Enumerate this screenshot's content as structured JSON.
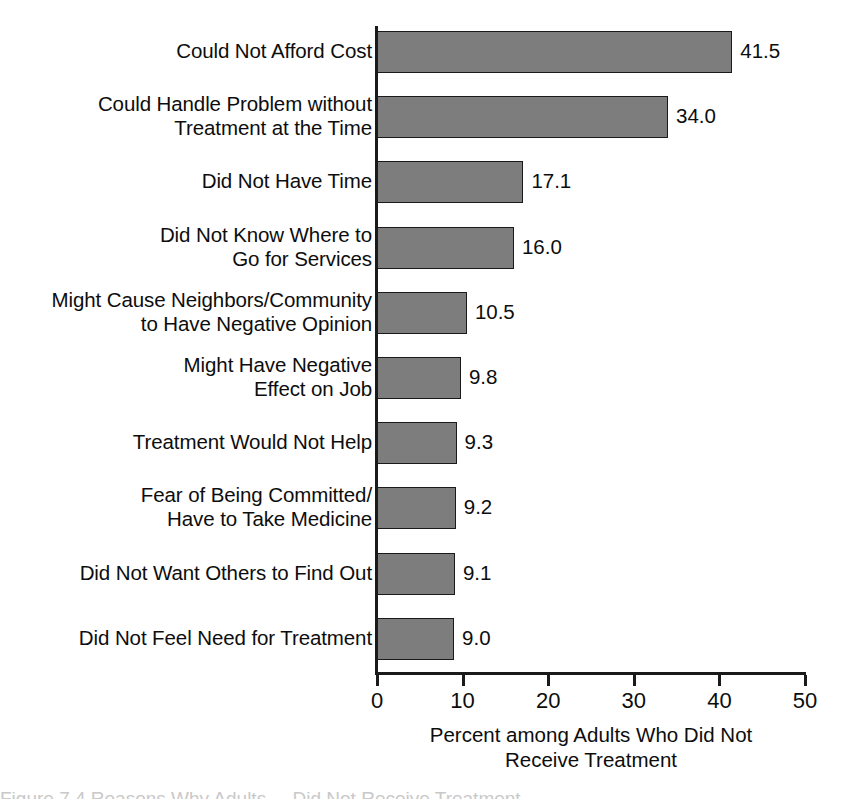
{
  "chart_data": {
    "type": "bar",
    "orientation": "horizontal",
    "title": "",
    "xlabel": "Percent among Adults Who Did Not\nReceive Treatment",
    "ylabel": "",
    "xlim": [
      0,
      50
    ],
    "xticks": [
      0,
      10,
      20,
      30,
      40,
      50
    ],
    "xtick_labels": [
      "0",
      "10",
      "20",
      "30",
      "40",
      "50"
    ],
    "grid": false,
    "legend": false,
    "bar_color": "#7d7d7d",
    "bar_edge_color": "#1a1a1a",
    "categories": [
      "Could Not Afford Cost",
      "Could Handle Problem without\nTreatment at the Time",
      "Did Not Have Time",
      "Did Not Know Where to\nGo for Services",
      "Might Cause Neighbors/Community\nto Have Negative Opinion",
      "Might Have Negative\nEffect on Job",
      "Treatment Would Not Help",
      "Fear of Being Committed/\nHave to Take Medicine",
      "Did Not Want Others to Find Out",
      "Did Not Feel Need for Treatment"
    ],
    "values": [
      41.5,
      34.0,
      17.1,
      16.0,
      10.5,
      9.8,
      9.3,
      9.2,
      9.1,
      9.0
    ],
    "value_labels": [
      "41.5",
      "34.0",
      "17.1",
      "16.0",
      "10.5",
      "9.8",
      "9.3",
      "9.2",
      "9.1",
      "9.0"
    ]
  },
  "caption_sliver": "Figure 7.4  Reasons Why Adults ... Did Not Receive Treatment"
}
